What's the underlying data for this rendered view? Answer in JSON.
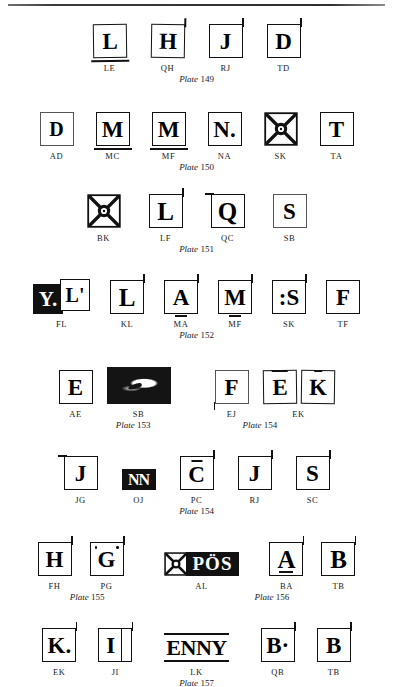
{
  "page": {
    "background": "#ffffff",
    "ink": "#111111",
    "has_top_rule": true
  },
  "plate_label_word": "Plate",
  "rows": [
    {
      "id": "row-plate-149",
      "plates": [
        {
          "number": "149",
          "align": "center"
        }
      ],
      "marks": [
        {
          "code": "LE",
          "glyph": "L",
          "style": "box",
          "notes": "underline stroke"
        },
        {
          "code": "QH",
          "glyph": "H",
          "style": "box",
          "notes": "dot below"
        },
        {
          "code": "RJ",
          "glyph": "J",
          "style": "box"
        },
        {
          "code": "TD",
          "glyph": "D",
          "style": "box",
          "notes": "apostrophe"
        }
      ]
    },
    {
      "id": "row-plate-150",
      "plates": [
        {
          "number": "150",
          "align": "center"
        }
      ],
      "marks": [
        {
          "code": "AD",
          "glyph": "D",
          "style": "box-thin"
        },
        {
          "code": "MC",
          "glyph": "M",
          "style": "box",
          "notes": "heavy underline"
        },
        {
          "code": "MF",
          "glyph": "M",
          "style": "box",
          "notes": "heavy underline"
        },
        {
          "code": "NA",
          "glyph": "N.",
          "style": "box"
        },
        {
          "code": "SK",
          "glyph": "star",
          "style": "starbox"
        },
        {
          "code": "TA",
          "glyph": "T",
          "style": "box"
        }
      ]
    },
    {
      "id": "row-plate-151",
      "plates": [
        {
          "number": "151",
          "align": "center"
        }
      ],
      "marks": [
        {
          "code": "BK",
          "glyph": "star",
          "style": "starbox"
        },
        {
          "code": "LF",
          "glyph": "L",
          "style": "box"
        },
        {
          "code": "QC",
          "glyph": "Q",
          "style": "box",
          "notes": "descender tail"
        },
        {
          "code": "SB",
          "glyph": "S",
          "style": "box-thin"
        }
      ]
    },
    {
      "id": "row-plate-152",
      "plates": [
        {
          "number": "152",
          "align": "center"
        }
      ],
      "marks": [
        {
          "code": "FL",
          "glyph": "Y.",
          "second_glyph": "L'",
          "style": "black-plus-box"
        },
        {
          "code": "KL",
          "glyph": "L",
          "style": "box"
        },
        {
          "code": "MA",
          "glyph": "A",
          "style": "box",
          "notes": "tick below"
        },
        {
          "code": "MF",
          "glyph": "M",
          "style": "box",
          "notes": "tick below"
        },
        {
          "code": "SK",
          "glyph": ":S",
          "style": "box"
        },
        {
          "code": "TF",
          "glyph": "F",
          "style": "box"
        }
      ]
    },
    {
      "id": "row-plate-153-154",
      "plates": [
        {
          "number": "153",
          "align": "left"
        },
        {
          "number": "154",
          "align": "right"
        }
      ],
      "marks": [
        {
          "code": "AE",
          "glyph": "E",
          "style": "box"
        },
        {
          "code": "SB",
          "glyph": "blotch",
          "style": "blotch"
        },
        {
          "code": "EJ",
          "glyph": "F",
          "style": "box-thin"
        },
        {
          "code": "EK",
          "glyph": "E",
          "second_glyph": "K",
          "style": "double-box"
        }
      ]
    },
    {
      "id": "row-plate-154b",
      "plates": [
        {
          "number": "154",
          "align": "center"
        }
      ],
      "marks": [
        {
          "code": "JG",
          "glyph": "J",
          "style": "box"
        },
        {
          "code": "OJ",
          "glyph": "NN",
          "style": "black-block"
        },
        {
          "code": "PC",
          "glyph": "C",
          "style": "box",
          "notes": "caron above"
        },
        {
          "code": "RJ",
          "glyph": "J",
          "style": "box",
          "notes": "dot below"
        },
        {
          "code": "SC",
          "glyph": "S",
          "style": "box"
        }
      ]
    },
    {
      "id": "row-plate-155-156",
      "plates": [
        {
          "number": "155",
          "align": "left"
        },
        {
          "number": "156",
          "align": "right"
        }
      ],
      "marks": [
        {
          "code": "FH",
          "glyph": "H",
          "style": "box"
        },
        {
          "code": "PG",
          "glyph": "G",
          "style": "box",
          "notes": "dots at corners"
        },
        {
          "code": "AL",
          "glyph": "PÖS",
          "style": "star-banner"
        },
        {
          "code": "BA",
          "glyph": "A",
          "style": "box"
        },
        {
          "code": "TB",
          "glyph": "B",
          "style": "box"
        }
      ]
    },
    {
      "id": "row-plate-157",
      "plates": [
        {
          "number": "157",
          "align": "center"
        }
      ],
      "marks": [
        {
          "code": "EK",
          "glyph": "K.",
          "style": "box"
        },
        {
          "code": "JI",
          "glyph": "I",
          "style": "box-split"
        },
        {
          "code": "LK",
          "glyph": "ENNY",
          "style": "rule-word"
        },
        {
          "code": "QB",
          "glyph": "B·",
          "style": "box"
        },
        {
          "code": "TB",
          "glyph": "B",
          "style": "box"
        }
      ]
    }
  ]
}
